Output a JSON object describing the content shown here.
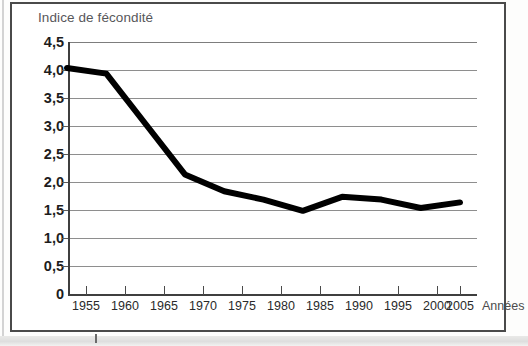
{
  "chart_data": {
    "type": "line",
    "title": "Indice de fécondité",
    "xlabel": "Années",
    "ylabel": "",
    "x": [
      1955,
      1960,
      1965,
      1970,
      1975,
      1980,
      1985,
      1990,
      1995,
      2000,
      2005
    ],
    "categories": [
      "1955",
      "1960",
      "1965",
      "1970",
      "1975",
      "1980",
      "1985",
      "1990",
      "1995",
      "2000",
      "2005"
    ],
    "values": [
      4.0,
      3.9,
      3.0,
      2.1,
      1.8,
      1.65,
      1.45,
      1.7,
      1.65,
      1.5,
      1.6
    ],
    "series": [
      {
        "name": "Indice de fécondité",
        "values": [
          4.0,
          3.9,
          3.0,
          2.1,
          1.8,
          1.65,
          1.45,
          1.7,
          1.65,
          1.5,
          1.6
        ]
      }
    ],
    "xlim": [
      1955,
      2005
    ],
    "ylim": [
      0,
      4.5
    ],
    "ytick_labels": [
      "4,5",
      "4,0",
      "3,5",
      "3,0",
      "2,5",
      "2,0",
      "1,5",
      "1,0",
      "0,5",
      "0"
    ],
    "ytick_values": [
      4.5,
      4.0,
      3.5,
      3.0,
      2.5,
      2.0,
      1.5,
      1.0,
      0.5,
      0
    ],
    "grid": true,
    "legend": false,
    "legend_position": "none",
    "line_color": "#000000",
    "grid_color": "#8e8e8e",
    "title_color": "#57575a"
  },
  "figure": {
    "title": "Indice de fécondité",
    "x_axis_title": "Années"
  }
}
